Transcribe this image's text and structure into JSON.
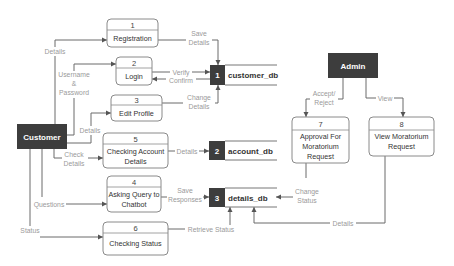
{
  "entities": {
    "customer": "Customer",
    "admin": "Admin"
  },
  "processes": [
    {
      "num": "1",
      "lines": [
        "Registration"
      ]
    },
    {
      "num": "2",
      "lines": [
        "Login"
      ]
    },
    {
      "num": "3",
      "lines": [
        "Edit Profile"
      ]
    },
    {
      "num": "5",
      "lines": [
        "Checking Account",
        "Details"
      ]
    },
    {
      "num": "4",
      "lines": [
        "Asking Query to",
        "Chatbot"
      ]
    },
    {
      "num": "6",
      "lines": [
        "Checking Status"
      ]
    },
    {
      "num": "7",
      "lines": [
        "Approval For",
        "Moratorium",
        "Request"
      ]
    },
    {
      "num": "8",
      "lines": [
        "View Moratorium",
        "Request"
      ]
    }
  ],
  "stores": [
    {
      "id": "1",
      "name": "customer_db"
    },
    {
      "id": "2",
      "name": "account_db"
    },
    {
      "id": "3",
      "name": "details_db"
    }
  ],
  "flows": {
    "details_reg": "Details",
    "username": [
      "Username",
      "&",
      "Password"
    ],
    "details_edit": "Details",
    "check_details": [
      "Check",
      "Details"
    ],
    "questions": "Questions",
    "status": "Status",
    "save_details": [
      "Save",
      "Details"
    ],
    "verify": "Verify",
    "confirm": "Confirm",
    "change_details": [
      "Change",
      "Details"
    ],
    "details_acc": "Details",
    "save_responses": [
      "Save",
      "Responses"
    ],
    "retrieve_status": "Retrieve Status",
    "accept_reject": [
      "Accept/",
      "Reject"
    ],
    "view": "View",
    "change_status": [
      "Change",
      "Status"
    ],
    "details_admin": "Details"
  }
}
